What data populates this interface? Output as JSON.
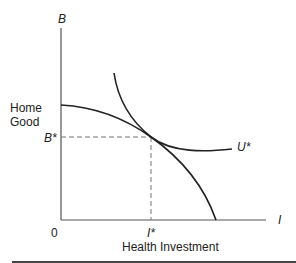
{
  "diagram": {
    "type": "economics-tangency",
    "y_axis": {
      "symbol": "B",
      "label_line1": "Home",
      "label_line2": "Good",
      "tick_label": "B*"
    },
    "x_axis": {
      "symbol": "I",
      "label": "Health Investment",
      "tick_label": "I*"
    },
    "origin_label": "0",
    "curves": [
      {
        "name": "production-possibility-frontier",
        "label": ""
      },
      {
        "name": "indifference-curve",
        "label": "U*"
      }
    ],
    "tangency_point": {
      "x_label": "I*",
      "y_label": "B*"
    },
    "colors": {
      "line": "#222222",
      "axis": "#555555",
      "dashed": "#777777",
      "rule": "#444444"
    }
  }
}
